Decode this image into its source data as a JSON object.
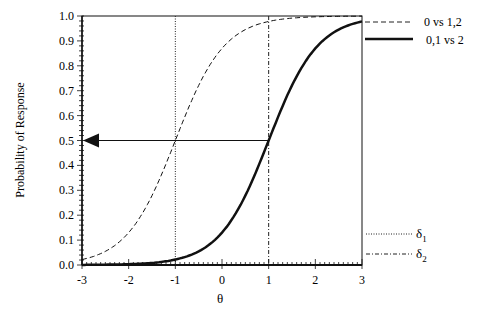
{
  "chart_data": {
    "type": "line",
    "title": "",
    "xlabel": "θ",
    "ylabel": "Probability of Response",
    "xlim": [
      -3,
      3
    ],
    "ylim": [
      0,
      1
    ],
    "x_ticks": [
      "-3",
      "-2",
      "-1",
      "0",
      "1",
      "2",
      "3"
    ],
    "y_ticks": [
      "0.0",
      "0.1",
      "0.2",
      "0.3",
      "0.4",
      "0.5",
      "0.6",
      "0.7",
      "0.8",
      "0.9",
      "1.0"
    ],
    "grid": false,
    "legend_position": "right",
    "series": [
      {
        "name": "0 vs 1,2",
        "style": "dashed",
        "x": [
          -3,
          -2.5,
          -2,
          -1.5,
          -1,
          -0.5,
          0,
          0.5,
          1,
          2,
          3
        ],
        "y": [
          0.0,
          0.02,
          0.11,
          0.27,
          0.5,
          0.76,
          0.92,
          0.98,
          0.99,
          1.0,
          1.0
        ]
      },
      {
        "name": "0,1 vs 2",
        "style": "solid",
        "x": [
          -3,
          -2,
          -1,
          -0.5,
          0,
          0.5,
          1,
          1.5,
          2,
          2.5,
          3
        ],
        "y": [
          0.0,
          0.0,
          0.01,
          0.03,
          0.08,
          0.24,
          0.5,
          0.76,
          0.93,
          0.98,
          1.0
        ]
      }
    ],
    "reference_lines": [
      {
        "name": "δ1",
        "x": -1,
        "style": "dotted"
      },
      {
        "name": "δ2",
        "x": 1,
        "style": "dash-dot"
      }
    ],
    "annotations": [
      {
        "type": "arrow",
        "from_x": 1,
        "to_x": -3,
        "y": 0.5
      }
    ],
    "legend": [
      "0 vs 1,2",
      "0,1 vs 2",
      "δ1",
      "δ2"
    ]
  },
  "labels": {
    "xlabel": "θ",
    "ylabel": "Probability of Response",
    "legend_dashed": "0 vs 1,2",
    "legend_solid": "0,1 vs 2",
    "legend_delta1": "δ",
    "legend_delta1_sub": "1",
    "legend_delta2": "δ",
    "legend_delta2_sub": "2"
  }
}
